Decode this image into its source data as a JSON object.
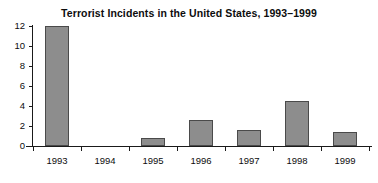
{
  "chart_data": {
    "type": "bar",
    "title": "Terrorist Incidents in the United States, 1993–1999",
    "subtitle": "",
    "xlabel": "",
    "ylabel": "",
    "categories": [
      "1993",
      "1994",
      "1995",
      "1996",
      "1997",
      "1998",
      "1999"
    ],
    "values": [
      12,
      0,
      0.8,
      2.6,
      1.6,
      4.5,
      1.4
    ],
    "series": [
      {
        "name": "Terrorist incidents",
        "values": [
          12,
          0,
          0.8,
          2.6,
          1.6,
          4.5,
          1.4
        ]
      }
    ],
    "ylim": [
      0,
      12
    ],
    "ytick_labels": [
      "0",
      "2",
      "4",
      "6",
      "8",
      "10",
      "12"
    ],
    "ytick_values": [
      0,
      2,
      4,
      6,
      8,
      10,
      12
    ],
    "grid": false,
    "legend": false,
    "legend_position": "none",
    "bar_color": "#8d8d8d",
    "bar_border_color": "#4a4a4a",
    "axis_color": "#1a1a1a",
    "background_color": "#ffffff",
    "text_color": "#0d0d0d",
    "annotations": []
  }
}
